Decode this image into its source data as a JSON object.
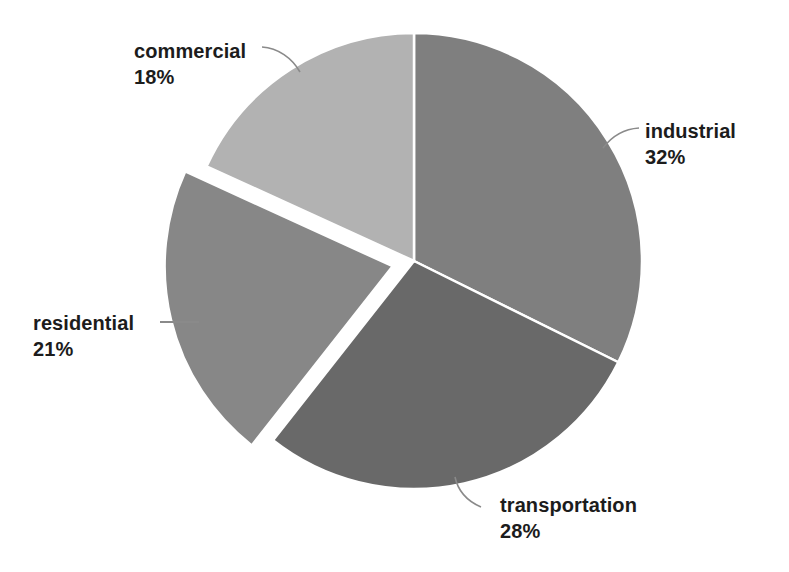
{
  "chart_data": {
    "type": "pie",
    "title": "",
    "categories": [
      "industrial",
      "transportation",
      "residential",
      "commercial"
    ],
    "values": [
      32,
      28,
      21,
      18
    ],
    "unit": "%",
    "labels": [
      {
        "name": "industrial",
        "value": "32%",
        "percent": 32,
        "color": "#7f7f7f",
        "exploded": false
      },
      {
        "name": "transportation",
        "value": "28%",
        "percent": 28,
        "color": "#696969",
        "exploded": false
      },
      {
        "name": "residential",
        "value": "21%",
        "percent": 21,
        "color": "#878787",
        "exploded": true
      },
      {
        "name": "commercial",
        "value": "18%",
        "percent": 18,
        "color": "#b2b2b2",
        "exploded": false
      }
    ],
    "start_angle_deg": 0,
    "direction": "clockwise",
    "legend": "none",
    "grid": false,
    "background": "#ffffff",
    "label_text_color": "#1c1c1c",
    "leader_line_color": "#8a8a8a",
    "slice_separator_color": "#ffffff"
  },
  "geometry": {
    "center_x": 414,
    "center_y": 261,
    "radius": 228,
    "explode_offset": 22
  }
}
